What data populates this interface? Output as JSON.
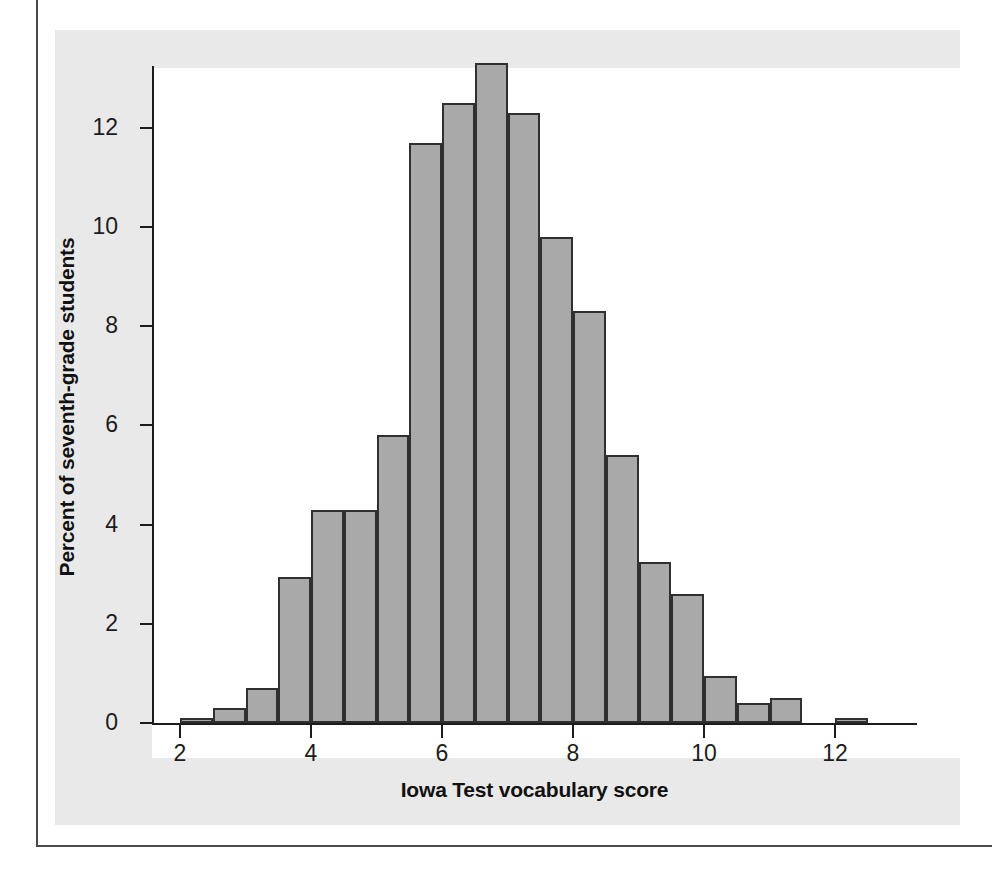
{
  "page": {
    "top_text": "",
    "figure_background": "#e9e9e9",
    "plot_background": "#ffffff",
    "rule_color": "#4a4a4a"
  },
  "chart_data": {
    "type": "bar",
    "title": "",
    "subtitle": "",
    "xlabel": "Iowa Test vocabulary score",
    "ylabel": "Percent of seventh-grade students",
    "xlim": [
      1.7,
      13.4
    ],
    "ylim": [
      0,
      13.8
    ],
    "xticks": [
      2,
      4,
      6,
      8,
      10,
      12
    ],
    "xtick_labels": [
      "2",
      "4",
      "6",
      "8",
      "10",
      "12"
    ],
    "yticks": [
      0,
      2,
      4,
      6,
      8,
      10,
      12
    ],
    "ytick_labels": [
      "0",
      "2",
      "4",
      "6",
      "8",
      "10",
      "12"
    ],
    "grid": false,
    "legend": null,
    "bin_width": 0.5,
    "bar_fill_color": "#a9a9a9",
    "bar_edge_color": "#303030",
    "bins": [
      {
        "left": 2.0,
        "right": 2.5,
        "center": 2.25,
        "value": 0.1
      },
      {
        "left": 2.5,
        "right": 3.0,
        "center": 2.75,
        "value": 0.3
      },
      {
        "left": 3.0,
        "right": 3.5,
        "center": 3.25,
        "value": 0.7
      },
      {
        "left": 3.5,
        "right": 4.0,
        "center": 3.75,
        "value": 2.95
      },
      {
        "left": 4.0,
        "right": 4.5,
        "center": 4.25,
        "value": 4.3
      },
      {
        "left": 4.5,
        "right": 5.0,
        "center": 4.75,
        "value": 4.3
      },
      {
        "left": 5.0,
        "right": 5.5,
        "center": 5.25,
        "value": 5.8
      },
      {
        "left": 5.5,
        "right": 6.0,
        "center": 5.75,
        "value": 11.7
      },
      {
        "left": 6.0,
        "right": 6.5,
        "center": 6.25,
        "value": 12.5
      },
      {
        "left": 6.5,
        "right": 7.0,
        "center": 6.75,
        "value": 13.3
      },
      {
        "left": 7.0,
        "right": 7.5,
        "center": 7.25,
        "value": 12.3
      },
      {
        "left": 7.5,
        "right": 8.0,
        "center": 7.75,
        "value": 9.8
      },
      {
        "left": 8.0,
        "right": 8.5,
        "center": 8.25,
        "value": 8.3
      },
      {
        "left": 8.5,
        "right": 9.0,
        "center": 8.75,
        "value": 5.4
      },
      {
        "left": 9.0,
        "right": 9.5,
        "center": 9.25,
        "value": 3.25
      },
      {
        "left": 9.5,
        "right": 10.0,
        "center": 9.75,
        "value": 2.6
      },
      {
        "left": 10.0,
        "right": 10.5,
        "center": 10.25,
        "value": 0.95
      },
      {
        "left": 10.5,
        "right": 11.0,
        "center": 10.75,
        "value": 0.4
      },
      {
        "left": 11.0,
        "right": 11.5,
        "center": 11.25,
        "value": 0.5
      },
      {
        "left": 11.5,
        "right": 12.0,
        "center": 11.75,
        "value": 0.0
      },
      {
        "left": 12.0,
        "right": 12.5,
        "center": 12.25,
        "value": 0.1
      }
    ]
  }
}
